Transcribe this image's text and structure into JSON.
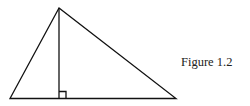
{
  "figure": {
    "caption": "Figure 1.2",
    "stroke_color": "#111111",
    "vertices": {
      "apex": [
        59,
        8
      ],
      "bottom_left": [
        10,
        98.5
      ],
      "bottom_right": [
        176,
        98.5
      ]
    },
    "altitude_foot": [
      59,
      98.5
    ],
    "right_angle_marker_size": 7
  }
}
